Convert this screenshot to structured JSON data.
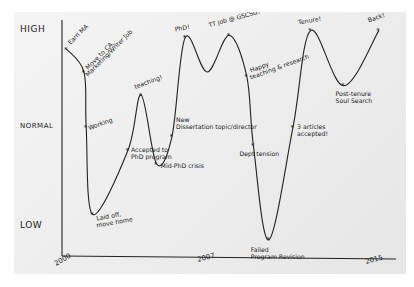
{
  "chart_data": {
    "type": "line",
    "title": "",
    "xlabel": "",
    "ylabel": "",
    "y_levels": [
      "LOW",
      "NORMAL",
      "HIGH"
    ],
    "ylim": [
      0,
      10
    ],
    "xlim": [
      2000,
      2015
    ],
    "x_ticks": [
      "2000",
      "2007",
      "2015"
    ],
    "grid": false,
    "style": "hand-drawn",
    "line_color": "#222222",
    "series": [
      {
        "name": "life",
        "points": [
          {
            "x": 2000.2,
            "y": 9.0,
            "label": "Earn MA"
          },
          {
            "x": 2001.0,
            "y": 8.0,
            "label": "Move to CA, Marketing/Writer Job"
          },
          {
            "x": 2001.1,
            "y": 5.6,
            "label": "Working"
          },
          {
            "x": 2001.4,
            "y": 1.8,
            "label": "Laid off, move home"
          },
          {
            "x": 2003.0,
            "y": 4.6,
            "label": "Accepted to PhD program"
          },
          {
            "x": 2003.6,
            "y": 7.0,
            "label": "teaching!"
          },
          {
            "x": 2004.3,
            "y": 4.0,
            "label": "Mid-PhD crisis"
          },
          {
            "x": 2005.0,
            "y": 5.2,
            "label": "New Dissertation topic/director"
          },
          {
            "x": 2005.6,
            "y": 9.5,
            "label": "PhD!"
          },
          {
            "x": 2006.6,
            "y": 8.0,
            "label": ""
          },
          {
            "x": 2007.6,
            "y": 9.6,
            "label": "TT job @ GSCSU!"
          },
          {
            "x": 2008.4,
            "y": 7.8,
            "label": "Happy teaching & research"
          },
          {
            "x": 2008.7,
            "y": 4.8,
            "label": "Dept tension"
          },
          {
            "x": 2009.4,
            "y": 0.7,
            "label": "Failed Program Revision"
          },
          {
            "x": 2010.5,
            "y": 5.6,
            "label": "3 articles accepted!"
          },
          {
            "x": 2011.3,
            "y": 9.8,
            "label": "Tenure!"
          },
          {
            "x": 2012.8,
            "y": 7.4,
            "label": "Post-tenure Soul Search"
          },
          {
            "x": 2014.4,
            "y": 9.8,
            "label": "Back!"
          }
        ]
      }
    ]
  }
}
